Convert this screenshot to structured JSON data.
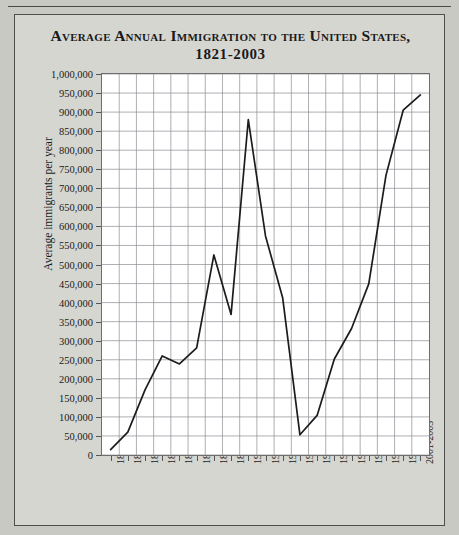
{
  "figure": {
    "title_line_1": "Average Annual Immigration to the United States,",
    "title_line_2": "1821-2003"
  },
  "chart_data": {
    "type": "line",
    "title": "Average Annual Immigration to the United States, 1821-2003",
    "xlabel": "",
    "ylabel": "Average immigrants per year",
    "ylim": [
      0,
      1000000
    ],
    "ytick_step": 50000,
    "grid": true,
    "legend": false,
    "line_color": "#1c1c1c",
    "plot_background": "#ffffff",
    "gridline_color": "#8c8c94",
    "categories": [
      "1821-1830",
      "1831-1840",
      "1841-1850",
      "1851-1860",
      "1861-1870",
      "1871-1880",
      "1881-1890",
      "1891-1900",
      "1901-1910",
      "1911-1920",
      "1921-1930",
      "1931-1940",
      "1941-1950",
      "1951-1960",
      "1961-1970",
      "1971-1980",
      "1981-1990",
      "1991-2000",
      "2001-2003"
    ],
    "values": [
      14000,
      60000,
      171000,
      260000,
      239000,
      281000,
      525000,
      369000,
      880000,
      575000,
      412000,
      53000,
      104000,
      252000,
      332000,
      449000,
      734000,
      905000,
      945000
    ],
    "ytick_labels": [
      "0",
      "50,000",
      "100,000",
      "150,000",
      "200,000",
      "250,000",
      "300,000",
      "350,000",
      "400,000",
      "450,000",
      "500,000",
      "550,000",
      "600,000",
      "650,000",
      "700,000",
      "750,000",
      "800,000",
      "850,000",
      "900,000",
      "950,000",
      "1,000,000"
    ]
  }
}
